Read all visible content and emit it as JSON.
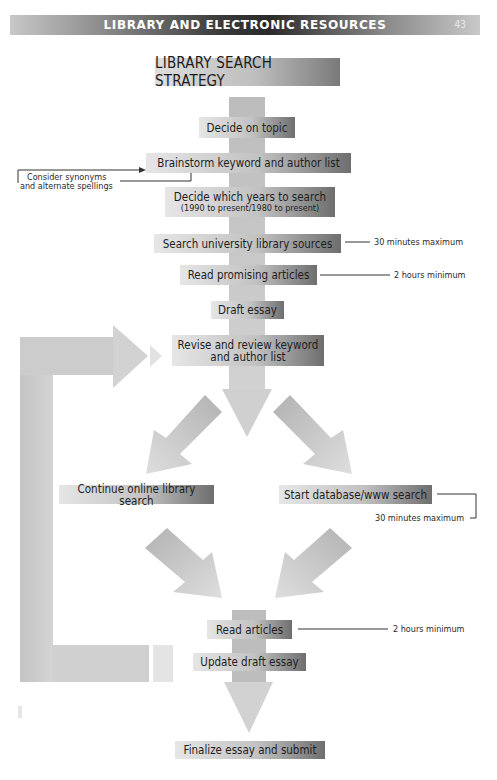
{
  "header": {
    "title": "LIBRARY AND ELECTRONIC RESOURCES",
    "page_number": "43"
  },
  "diagram": {
    "title": "LIBRARY SEARCH STRATEGY",
    "steps": [
      {
        "id": "decide-topic",
        "label": "Decide on topic"
      },
      {
        "id": "brainstorm",
        "label": "Brainstorm keyword and author list"
      },
      {
        "id": "decide-years",
        "label": "Decide which years to search",
        "sublabel": "(1990 to present/1980 to present)"
      },
      {
        "id": "search-university",
        "label": "Search university library sources"
      },
      {
        "id": "read-promising",
        "label": "Read promising articles"
      },
      {
        "id": "draft-essay",
        "label": "Draft essay"
      },
      {
        "id": "revise",
        "label": "Revise and review keyword",
        "label2": "and author list"
      },
      {
        "id": "continue-online",
        "label": "Continue online library search"
      },
      {
        "id": "start-database",
        "label": "Start database/www search"
      },
      {
        "id": "read-articles",
        "label": "Read articles"
      },
      {
        "id": "update-draft",
        "label": "Update draft essay"
      },
      {
        "id": "finalize",
        "label": "Finalize essay and submit"
      }
    ],
    "annotations": {
      "synonyms_line1": "Consider synonyms",
      "synonyms_line2": "and alternate spellings",
      "search_university_time": "30 minutes maximum",
      "read_promising_time": "2 hours minimum",
      "database_time": "30 minutes maximum",
      "read_articles_time": "2 hours minimum"
    },
    "colors": {
      "header_dark": "#2a2a2a",
      "box_light": "#e6e6e6",
      "box_dark": "#6e6e6e",
      "arrow": "#c4c4c4"
    }
  }
}
